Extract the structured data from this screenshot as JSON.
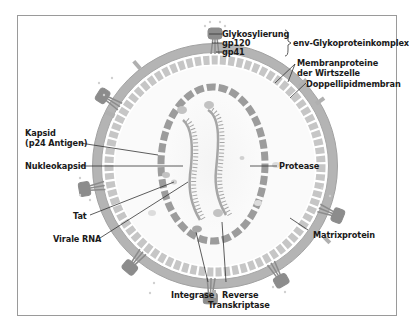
{
  "diagram": {
    "colors": {
      "membrane": "#b8b8b8",
      "membrane_edge": "#9c9c9c",
      "matrix": "#c4c4c4",
      "capsid": "#9e9e9e",
      "rna": "#a8a8a8",
      "glycoprotein": "#8a8a8a",
      "leader": "#333333",
      "frame": "#9a9a9a"
    },
    "labels": {
      "glykosylierung": "Glykosylierung",
      "gp120": "gp120",
      "gp41": "gp41",
      "env_complex": "env-Glykoproteinkomplex",
      "membranproteine_1": "Membranproteine",
      "membranproteine_2": "der Wirtszelle",
      "doppellipidmembran": "Doppellipidmembran",
      "kapsid_1": "Kapsid",
      "kapsid_2": "(p24 Antigen)",
      "nukleokapsid": "Nukleokapsid",
      "protease": "Protease",
      "tat": "Tat",
      "virale_rna": "Virale RNA",
      "matrixprotein": "Matrixprotein",
      "integrase": "Integrase",
      "reverse_1": "Reverse",
      "reverse_2": "Transkriptase"
    }
  }
}
